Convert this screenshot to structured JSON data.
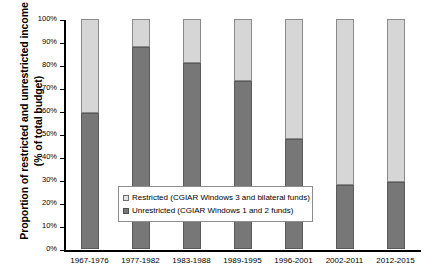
{
  "chart_data": {
    "type": "bar",
    "stacked": true,
    "stacked_percent": true,
    "title": "",
    "xlabel": "",
    "ylabel": "Proportion of restricted and unrestricted income (% of total budget)",
    "categories": [
      "1967-1976",
      "1977-1982",
      "1983-1988",
      "1989-1995",
      "1996-2001",
      "2002-2011",
      "2012-2015"
    ],
    "series": [
      {
        "name": "Unrestricted (CGIAR Windows 1 and 2 funds)",
        "color": "#777777",
        "values": [
          59,
          88,
          81,
          73,
          48,
          28,
          29
        ]
      },
      {
        "name": "Restricted (CGIAR Windows 3 and bilateral funds)",
        "color": "#d6d6d6",
        "values": [
          41,
          12,
          19,
          27,
          52,
          72,
          71
        ]
      }
    ],
    "ylim": [
      0,
      100
    ],
    "yticks": [
      0,
      10,
      20,
      30,
      40,
      50,
      60,
      70,
      80,
      90,
      100
    ],
    "ytick_labels": [
      "0%",
      "10%",
      "20%",
      "30%",
      "40%",
      "50%",
      "60%",
      "70%",
      "80%",
      "90%",
      "100%"
    ],
    "grid": false,
    "legend_position": "center"
  },
  "axis": {
    "y_title": "Proportion of restricted and unrestricted income (% of total budget)"
  },
  "legend": {
    "items": [
      {
        "label": "Restricted (CGIAR Windows 3 and bilateral funds)",
        "swatch": "restricted-swatch"
      },
      {
        "label": "Unrestricted (CGIAR Windows 1 and 2 funds)",
        "swatch": "unrestricted-swatch"
      }
    ]
  },
  "colors": {
    "restricted": "#d6d6d6",
    "unrestricted": "#777777",
    "axis": "#000000",
    "background": "#ffffff"
  }
}
